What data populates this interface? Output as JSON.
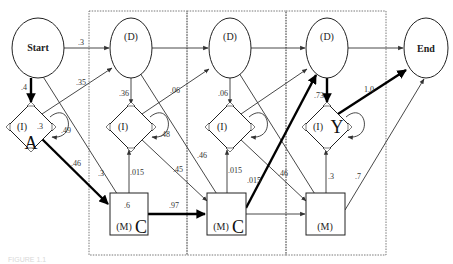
{
  "diagram": {
    "type": "profile HMM state diagram",
    "nodes": {
      "start": {
        "label": "Start"
      },
      "end": {
        "label": "End"
      },
      "delete": [
        {
          "label": "(D)"
        },
        {
          "label": "(D)"
        },
        {
          "label": "(D)"
        }
      ],
      "insert": [
        {
          "label": "(I)",
          "emission": "A",
          "inner_value": ".3"
        },
        {
          "label": "(I)",
          "emission": ""
        },
        {
          "label": "(I)",
          "emission": ""
        },
        {
          "label": "(I)",
          "emission": "Y"
        }
      ],
      "match": [
        {
          "label": "(M)",
          "emission": "C",
          "inner_value": ".6"
        },
        {
          "label": "(M)",
          "emission": "C"
        },
        {
          "label": "(M)",
          "emission": ""
        }
      ]
    },
    "edge_labels": {
      "start_to_d1": ".3",
      "start_to_i0": ".4",
      "i0_to_d1": ".35",
      "i0_self": ".49",
      "i0_to_m1": ".46",
      "start_to_m1": ".3",
      "d1_to_i1": ".36",
      "i1_self": ".48",
      "i1_to_d2": ".06",
      "m1_to_i1": ".015",
      "i1_to_m2": ".45",
      "m1_to_m2": ".97",
      "d1_to_m2": ".46",
      "d2_to_i2": ".06",
      "m2_to_i2": ".015",
      "m2_to_d3": ".015",
      "d2_to_m3": ".46",
      "d3_to_i3": ".73",
      "i3_to_end": "1.0",
      "m3_to_i3": ".3",
      "m3_to_end": ".7"
    },
    "caption": "FIGURE 1.1"
  }
}
